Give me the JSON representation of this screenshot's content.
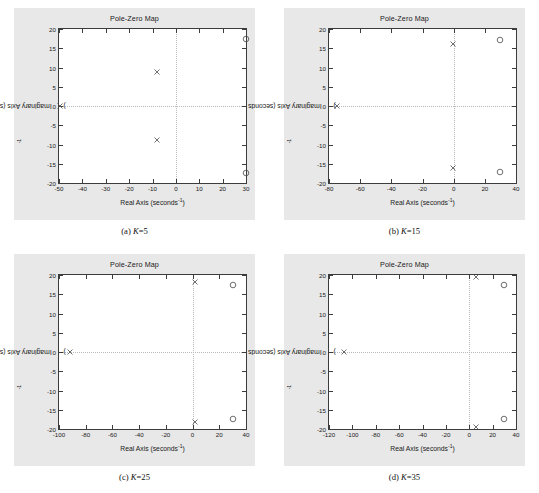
{
  "page": {
    "background": "#ffffff",
    "panel_background": "#e8e8e8",
    "axes_background": "#ffffff",
    "axis_color": "#3c3c3c",
    "grid_color": "#b9b9b9",
    "marker_color": "#4a4a4a"
  },
  "labels": {
    "title": "Pole-Zero Map",
    "xtitle_text": "Real Axis (seconds",
    "xtitle_exp": "-1",
    "xtitle_tail": ")",
    "ytitle_text": "Imaginary Axis (seconds",
    "ytitle_exp": "-1",
    "ytitle_tail": ")"
  },
  "figures": [
    {
      "id": "a",
      "caption_prefix": "(a) ",
      "caption_var": "K",
      "caption_value": "=5",
      "chart_data": {
        "type": "scatter",
        "title": "Pole-Zero Map",
        "xlabel": "Real Axis (seconds^-1)",
        "ylabel": "Imaginary Axis (seconds^-1)",
        "xlim": [
          -50,
          30
        ],
        "ylim": [
          -20,
          20
        ],
        "xticks": [
          -50,
          -40,
          -30,
          -20,
          -10,
          0,
          10,
          20,
          30
        ],
        "xticklabels": [
          "-50",
          "-40",
          "-30",
          "-20",
          "-10",
          "0",
          "10",
          "20",
          "30"
        ],
        "yticks": [
          20,
          15,
          10,
          5,
          0,
          -5,
          -10,
          -15,
          -20
        ],
        "yticklabels": [
          "20",
          "15",
          "10",
          "5",
          "0",
          "-5",
          "-10",
          "-15",
          "-20"
        ],
        "grid": false,
        "legend": "none",
        "series": [
          {
            "name": "poles",
            "marker": "x",
            "points": [
              {
                "x": -8.0,
                "y": 8.9
              },
              {
                "x": -8.0,
                "y": -8.9
              },
              {
                "x": -49.6,
                "y": 0.0
              }
            ]
          },
          {
            "name": "zeros",
            "marker": "o",
            "points": [
              {
                "x": 29.9,
                "y": 17.3
              },
              {
                "x": 29.9,
                "y": -17.3
              }
            ]
          }
        ]
      }
    },
    {
      "id": "b",
      "caption_prefix": "(b) ",
      "caption_var": "K",
      "caption_value": "=15",
      "chart_data": {
        "type": "scatter",
        "title": "Pole-Zero Map",
        "xlabel": "Real Axis (seconds^-1)",
        "ylabel": "Imaginary Axis (seconds^-1)",
        "xlim": [
          -80,
          40
        ],
        "ylim": [
          -20,
          20
        ],
        "xticks": [
          -80,
          -60,
          -40,
          -20,
          0,
          20,
          40
        ],
        "xticklabels": [
          "-80",
          "-60",
          "-40",
          "-20",
          "0",
          "20",
          "40"
        ],
        "yticks": [
          20,
          15,
          10,
          5,
          0,
          -5,
          -10,
          -15,
          -20
        ],
        "yticklabels": [
          "20",
          "15",
          "10",
          "5",
          "0",
          "-5",
          "-10",
          "-15",
          "-20"
        ],
        "grid": false,
        "legend": "none",
        "series": [
          {
            "name": "poles",
            "marker": "x",
            "points": [
              {
                "x": -75.0,
                "y": 0.0
              },
              {
                "x": -0.6,
                "y": 16.0
              },
              {
                "x": -0.6,
                "y": -16.0
              }
            ]
          },
          {
            "name": "zeros",
            "marker": "o",
            "points": [
              {
                "x": 30.0,
                "y": 17.2
              },
              {
                "x": 30.0,
                "y": -17.2
              }
            ]
          }
        ]
      }
    },
    {
      "id": "c",
      "caption_prefix": "(c) ",
      "caption_var": "K",
      "caption_value": "=25",
      "chart_data": {
        "type": "scatter",
        "title": "Pole-Zero Map",
        "xlabel": "Real Axis (seconds^-1)",
        "ylabel": "Imaginary Axis (seconds^-1)",
        "xlim": [
          -100,
          40
        ],
        "ylim": [
          -20,
          20
        ],
        "xticks": [
          -100,
          -80,
          -60,
          -40,
          -20,
          0,
          20,
          40
        ],
        "xticklabels": [
          "-100",
          "-80",
          "-60",
          "-40",
          "-20",
          "0",
          "20",
          "40"
        ],
        "yticks": [
          20,
          15,
          10,
          5,
          0,
          -5,
          -10,
          -15,
          -20
        ],
        "yticklabels": [
          "20",
          "15",
          "10",
          "5",
          "0",
          "-5",
          "-10",
          "-15",
          "-20"
        ],
        "grid": false,
        "legend": "none",
        "series": [
          {
            "name": "poles",
            "marker": "x",
            "points": [
              {
                "x": -92.0,
                "y": 0.0
              },
              {
                "x": 2.0,
                "y": 18.1
              },
              {
                "x": 2.0,
                "y": -18.1
              }
            ]
          },
          {
            "name": "zeros",
            "marker": "o",
            "points": [
              {
                "x": 30.0,
                "y": 17.3
              },
              {
                "x": 30.0,
                "y": -17.3
              }
            ]
          }
        ]
      }
    },
    {
      "id": "d",
      "caption_prefix": "(d) ",
      "caption_var": "K",
      "caption_value": "=35",
      "chart_data": {
        "type": "scatter",
        "title": "Pole-Zero Map",
        "xlabel": "Real Axis (seconds^-1)",
        "ylabel": "Imaginary Axis (seconds^-1)",
        "xlim": [
          -120,
          40
        ],
        "ylim": [
          -20,
          20
        ],
        "xticks": [
          -120,
          -100,
          -80,
          -60,
          -40,
          -20,
          0,
          20,
          40
        ],
        "xticklabels": [
          "-120",
          "-100",
          "-80",
          "-60",
          "-40",
          "-20",
          "0",
          "20",
          "40"
        ],
        "yticks": [
          20,
          15,
          10,
          5,
          0,
          -5,
          -10,
          -15,
          -20
        ],
        "yticklabels": [
          "20",
          "15",
          "10",
          "5",
          "0",
          "-5",
          "-10",
          "-15",
          "-20"
        ],
        "grid": false,
        "legend": "none",
        "series": [
          {
            "name": "poles",
            "marker": "x",
            "points": [
              {
                "x": -107.0,
                "y": 0.0
              },
              {
                "x": 6.0,
                "y": 19.6
              },
              {
                "x": 6.0,
                "y": -19.6
              }
            ]
          },
          {
            "name": "zeros",
            "marker": "o",
            "points": [
              {
                "x": 30.0,
                "y": 17.3
              },
              {
                "x": 30.0,
                "y": -17.3
              }
            ]
          }
        ]
      }
    }
  ]
}
